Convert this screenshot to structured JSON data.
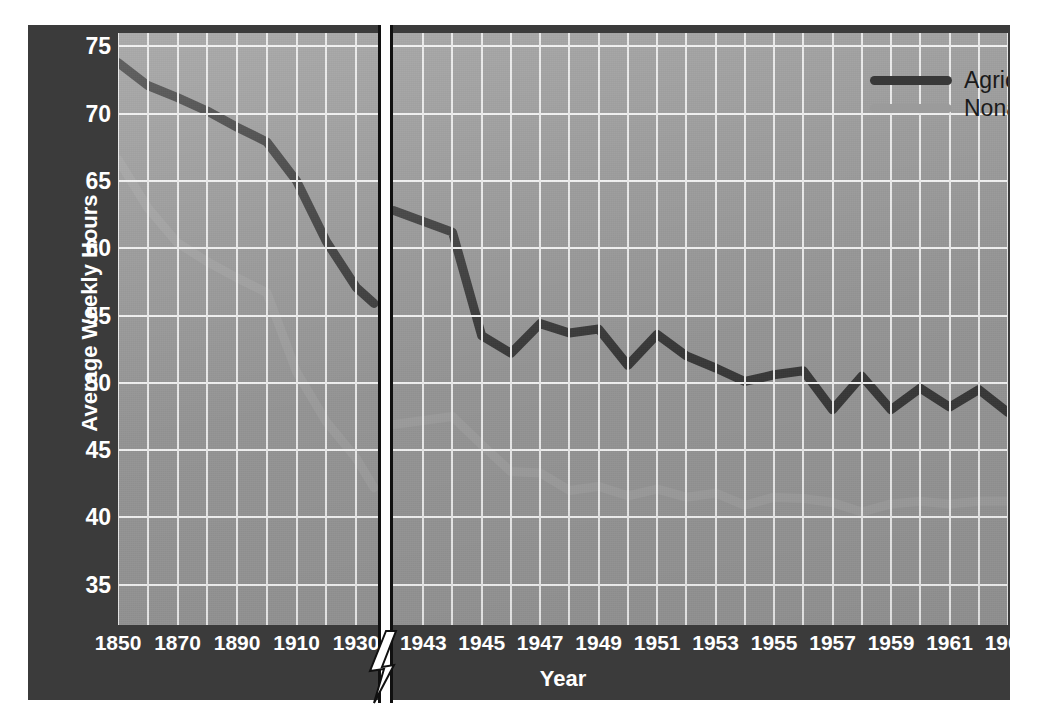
{
  "chart_data": {
    "type": "line",
    "title": "",
    "xlabel": "Year",
    "ylabel": "Average Weekly Hours",
    "ylim": [
      32,
      76
    ],
    "yticks": [
      75,
      70,
      65,
      60,
      55,
      50,
      45,
      40,
      35
    ],
    "grid": true,
    "legend_position": "top-right",
    "axis_break": {
      "present": true,
      "between": [
        1930,
        1943
      ],
      "style": "lightning-bolt"
    },
    "segments": [
      {
        "name": "historical",
        "xticks": [
          1850,
          1870,
          1890,
          1910,
          1930
        ],
        "x_range": [
          1850,
          1936
        ],
        "gridline_step_years": 10,
        "series": [
          {
            "name": "Agriculture",
            "color": "#383838",
            "x": [
              1850,
              1860,
              1870,
              1880,
              1890,
              1900,
              1910,
              1920,
              1930,
              1936
            ],
            "values": [
              73.8,
              72.1,
              71.2,
              70.2,
              69.0,
              67.9,
              65.0,
              60.5,
              57.1,
              55.9
            ]
          },
          {
            "name": "Nonagriculture",
            "color": "#9b9b9b",
            "x": [
              1850,
              1860,
              1870,
              1880,
              1890,
              1900,
              1910,
              1920,
              1930,
              1936
            ],
            "values": [
              66.6,
              63.0,
              60.4,
              59.0,
              57.8,
              56.7,
              50.8,
              47.1,
              44.4,
              42.2
            ]
          }
        ]
      },
      {
        "name": "modern",
        "xticks": [
          1943,
          1945,
          1947,
          1949,
          1951,
          1953,
          1955,
          1957,
          1959,
          1961,
          1963
        ],
        "x_range": [
          1942,
          1963
        ],
        "gridline_step_years": 1,
        "series": [
          {
            "name": "Agriculture",
            "color": "#383838",
            "x": [
              1942,
              1943,
              1944,
              1945,
              1946,
              1947,
              1948,
              1949,
              1950,
              1951,
              1952,
              1953,
              1954,
              1955,
              1956,
              1957,
              1958,
              1959,
              1960,
              1961,
              1962,
              1963
            ],
            "values": [
              62.8,
              62.0,
              61.2,
              53.5,
              52.2,
              54.4,
              53.7,
              54.0,
              51.3,
              53.6,
              52.0,
              51.1,
              50.1,
              50.6,
              50.9,
              48.0,
              50.5,
              48.0,
              49.6,
              48.2,
              49.5,
              47.8
            ]
          },
          {
            "name": "Nonagriculture",
            "color": "#9b9b9b",
            "x": [
              1942,
              1943,
              1944,
              1945,
              1946,
              1947,
              1948,
              1949,
              1950,
              1951,
              1952,
              1953,
              1954,
              1955,
              1956,
              1957,
              1958,
              1959,
              1960,
              1961,
              1962,
              1963
            ],
            "values": [
              46.9,
              47.2,
              47.5,
              45.4,
              43.4,
              43.3,
              42.0,
              42.3,
              41.6,
              42.1,
              41.5,
              41.8,
              40.9,
              41.5,
              41.4,
              41.1,
              40.4,
              41.0,
              41.2,
              41.0,
              41.2,
              41.2
            ]
          }
        ]
      }
    ],
    "legend": [
      {
        "label": "Agriculture",
        "color": "#383838"
      },
      {
        "label": "Nonagriculture",
        "color": "#9b9b9b"
      }
    ]
  },
  "axis": {
    "ylabel": "Average Weekly Hours",
    "xlabel": "Year",
    "yticks": [
      "75",
      "70",
      "65",
      "60",
      "55",
      "50",
      "45",
      "40",
      "35"
    ],
    "xticks": [
      "1850",
      "1870",
      "1890",
      "1910",
      "1930",
      "1943",
      "1945",
      "1947",
      "1949",
      "1951",
      "1953",
      "1955",
      "1957",
      "1959",
      "1961",
      "1963"
    ]
  },
  "legend": {
    "items": [
      {
        "label": "Agriculture"
      },
      {
        "label": "Nonagriculture"
      }
    ]
  },
  "colors": {
    "frame": "#3b3b3b",
    "plot_background": "#949494",
    "grid": "#f0f0f0",
    "agriculture": "#383838",
    "nonagriculture": "#9b9b9b",
    "tick_text": "#ffffff",
    "legend_text": "#1a1a1a"
  }
}
